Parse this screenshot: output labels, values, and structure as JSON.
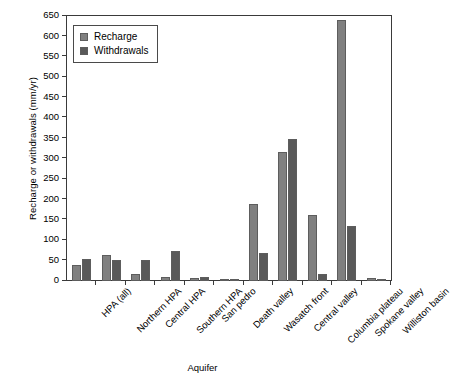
{
  "chart_data": {
    "type": "bar",
    "title": "",
    "xlabel": "Aquifer",
    "ylabel": "Recharge or withdrawals (mm/yr)",
    "ylim": [
      0,
      650
    ],
    "ytick_step": 50,
    "yticks": [
      0,
      50,
      100,
      150,
      200,
      250,
      300,
      350,
      400,
      450,
      500,
      550,
      600,
      650
    ],
    "ytick_labels": [
      "0",
      "50",
      "100",
      "150",
      "200",
      "250",
      "300",
      "350",
      "400",
      "450",
      "500",
      "550",
      "600",
      "650"
    ],
    "grid": false,
    "legend_position": "upper-left-inside",
    "categories": [
      "HPA (all)",
      "Northern HPA",
      "Central HPA",
      "Southern HPA",
      "San pedro",
      "Death valley",
      "Wasatch front",
      "Central valley",
      "Columbia plateau",
      "Spokane valley",
      "Williston basin"
    ],
    "series": [
      {
        "name": "Recharge",
        "color": "#808080",
        "values": [
          40,
          65,
          18,
          10,
          7,
          3,
          189,
          316,
          162,
          640,
          7
        ]
      },
      {
        "name": "Withdrawals",
        "color": "#595959",
        "values": [
          54,
          51,
          51,
          73,
          9,
          2,
          69,
          348,
          16,
          136,
          4
        ]
      }
    ]
  },
  "legend": {
    "items": [
      {
        "label": "Recharge",
        "swatch": "recharge"
      },
      {
        "label": "Withdrawals",
        "swatch": "withdrawals"
      }
    ]
  },
  "axes": {
    "y_title": "Recharge or withdrawals (mm/yr)",
    "x_title": "Aquifer"
  }
}
